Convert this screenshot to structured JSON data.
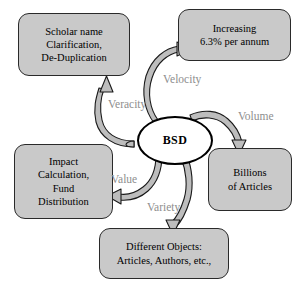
{
  "diagram": {
    "title": "BSD",
    "center": {
      "label": "BSD",
      "shape": "ellipse",
      "fill": "#ffffff",
      "stroke": "#000000"
    },
    "node_fill": "#c9c9c9",
    "node_stroke": "#2a2a2a",
    "edge_label_color": "#8e8e8e",
    "arrow_fill": "#bdbdbd",
    "arrow_stroke": "#1a1a1a",
    "nodes": [
      {
        "id": "scholar",
        "lines": [
          "Scholar name",
          "Clarification,",
          "De-Duplication"
        ],
        "position": "top-left"
      },
      {
        "id": "increasing",
        "lines": [
          "Increasing",
          "6.3% per annum"
        ],
        "position": "top-right"
      },
      {
        "id": "billions",
        "lines": [
          "Billions",
          "of Articles"
        ],
        "position": "right"
      },
      {
        "id": "objects",
        "lines": [
          "Different Objects:",
          "Articles, Authors, etc.,"
        ],
        "position": "bottom"
      },
      {
        "id": "impact",
        "lines": [
          "Impact",
          "Calculation,",
          "Fund",
          "Distribution"
        ],
        "position": "left"
      }
    ],
    "edges": [
      {
        "id": "velocity",
        "label": "Velocity",
        "from": "BSD",
        "to": "increasing"
      },
      {
        "id": "veracity",
        "label": "Veracity",
        "from": "BSD",
        "to": "scholar"
      },
      {
        "id": "volume",
        "label": "Volume",
        "from": "BSD",
        "to": "billions"
      },
      {
        "id": "value",
        "label": "Value",
        "from": "BSD",
        "to": "impact"
      },
      {
        "id": "variety",
        "label": "Variety",
        "from": "BSD",
        "to": "objects"
      }
    ]
  }
}
